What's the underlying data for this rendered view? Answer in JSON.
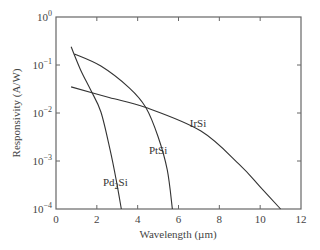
{
  "chart_data": {
    "type": "line",
    "title": "",
    "xlabel": "Wavelength (µm)",
    "ylabel": "Responsivity (A/W)",
    "xscale": "linear",
    "yscale": "log",
    "xlim": [
      0,
      12
    ],
    "ylim": [
      0.0001,
      1
    ],
    "xticks": [
      0,
      2,
      4,
      6,
      8,
      10,
      12
    ],
    "yticks": [
      {
        "value": 1,
        "label_base": "10",
        "label_exp": "0"
      },
      {
        "value": 0.1,
        "label_base": "10",
        "label_exp": "−1"
      },
      {
        "value": 0.01,
        "label_base": "10",
        "label_exp": "−2"
      },
      {
        "value": 0.001,
        "label_base": "10",
        "label_exp": "−3"
      },
      {
        "value": 0.0001,
        "label_base": "10",
        "label_exp": "−4"
      }
    ],
    "grid": false,
    "legend": "inline labels",
    "series": [
      {
        "name": "Pd2Si",
        "label_main": "Pd",
        "label_sub": "2",
        "label_tail": "Si",
        "label_pos": {
          "x": 2.3,
          "y": 0.0003
        },
        "x": [
          0.74,
          1.2,
          1.7,
          2.2,
          2.65,
          2.95,
          3.2
        ],
        "y": [
          0.24,
          0.08,
          0.03,
          0.0105,
          0.0017,
          0.0004,
          0.0001
        ]
      },
      {
        "name": "PtSi",
        "label_main": "PtSi",
        "label_sub": "",
        "label_tail": "",
        "label_pos": {
          "x": 4.55,
          "y": 0.0014
        },
        "x": [
          0.9,
          2.2,
          3.6,
          4.4,
          5.0,
          5.45,
          5.7
        ],
        "y": [
          0.17,
          0.095,
          0.033,
          0.013,
          0.0032,
          0.00065,
          0.0001
        ]
      },
      {
        "name": "IrSi",
        "label_main": "IrSi",
        "label_sub": "",
        "label_tail": "",
        "label_pos": {
          "x": 6.55,
          "y": 0.0052
        },
        "x": [
          0.74,
          2.6,
          4.4,
          7.1,
          9.0,
          10.0,
          11.0
        ],
        "y": [
          0.035,
          0.021,
          0.013,
          0.0042,
          0.00083,
          0.00029,
          0.0001
        ]
      }
    ]
  },
  "style": {
    "line_color": "#333333",
    "axis_color": "#666666"
  }
}
